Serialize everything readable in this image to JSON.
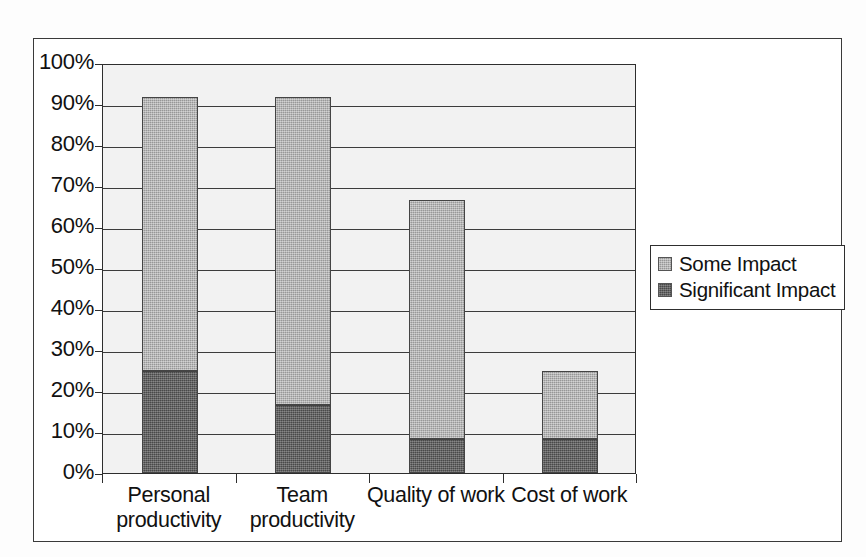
{
  "chart_data": {
    "type": "bar",
    "subtype": "stacked-column",
    "title": "",
    "xlabel": "",
    "ylabel": "",
    "categories": [
      "Personal productivity",
      "Team productivity",
      "Quality of work",
      "Cost of work"
    ],
    "category_lines": [
      [
        "Personal",
        "productivity"
      ],
      [
        "Team",
        "productivity"
      ],
      [
        "Quality of work",
        ""
      ],
      [
        "Cost of work",
        ""
      ]
    ],
    "series": [
      {
        "name": "Some Impact",
        "color": "#a8a8a8",
        "values": [
          66.7,
          75.0,
          58.3,
          16.7
        ]
      },
      {
        "name": "Significant Impact",
        "color": "#5a5a5a",
        "values": [
          25.0,
          16.7,
          8.3,
          8.3
        ]
      }
    ],
    "stack_totals": [
      91.7,
      91.7,
      66.7,
      25.0
    ],
    "ylim": [
      0,
      100
    ],
    "ytick_values": [
      0,
      10,
      20,
      30,
      40,
      50,
      60,
      70,
      80,
      90,
      100
    ],
    "ytick_labels": [
      "0%",
      "10%",
      "20%",
      "30%",
      "40%",
      "50%",
      "60%",
      "70%",
      "80%",
      "90%",
      "100%"
    ],
    "grid": true,
    "legend_position": "right-outside",
    "value_unit": "percent"
  },
  "legend": {
    "items": [
      {
        "label": "Some Impact",
        "color": "#a8a8a8"
      },
      {
        "label": "Significant Impact",
        "color": "#5a5a5a"
      }
    ]
  },
  "colors": {
    "some_impact": "#a8a8a8",
    "significant_impact": "#5a5a5a",
    "axis": "#2e2e2e",
    "gridline": "#3c3c3c",
    "frame": "#3a3a3a",
    "plot_background": "#f2f2f2",
    "page_background": "#ffffff"
  }
}
